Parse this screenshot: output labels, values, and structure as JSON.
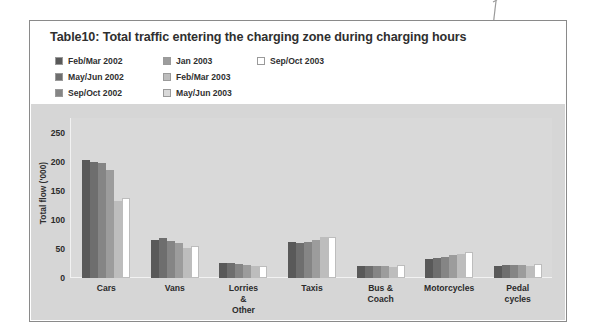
{
  "figure": {
    "title": "Table10: Total traffic entering the charging zone during charging hours",
    "annotation_dot": "callout-dot"
  },
  "legend": {
    "columns": [
      [
        {
          "label": "Feb/Mar 2002",
          "color": "#595959"
        },
        {
          "label": "May/Jun 2002",
          "color": "#6e6e6e"
        },
        {
          "label": "Sep/Oct 2002",
          "color": "#858585"
        }
      ],
      [
        {
          "label": "Jan 2003",
          "color": "#9c9c9c"
        },
        {
          "label": "Feb/Mar 2003",
          "color": "#bdbdbd"
        },
        {
          "label": "May/Jun 2003",
          "color": "#d9d9d9"
        }
      ],
      [
        {
          "label": "Sep/Oct 2003",
          "color": "#ffffff"
        }
      ]
    ]
  },
  "chart_data": {
    "type": "bar",
    "title": "Table10: Total traffic entering the charging zone during charging hours",
    "xlabel": "",
    "ylabel": "Total flow ('000)",
    "ylim": [
      0,
      275
    ],
    "yticks": [
      0,
      50,
      100,
      150,
      200,
      250
    ],
    "grid": false,
    "legend_position": "top",
    "categories": [
      "Cars",
      "Vans",
      "Lorries &\nOther",
      "Taxis",
      "Bus & Coach",
      "Motorcycles",
      "Pedal cycles"
    ],
    "series": [
      {
        "name": "Feb/Mar 2002",
        "color": "#595959",
        "values": [
          203,
          66,
          25,
          62,
          21,
          33,
          20
        ]
      },
      {
        "name": "May/Jun 2002",
        "color": "#6e6e6e",
        "values": [
          200,
          68,
          25,
          61,
          21,
          35,
          22
        ]
      },
      {
        "name": "Sep/Oct 2002",
        "color": "#858585",
        "values": [
          198,
          64,
          24,
          62,
          21,
          36,
          23
        ]
      },
      {
        "name": "Jan 2003",
        "color": "#9c9c9c",
        "values": [
          185,
          60,
          23,
          66,
          20,
          40,
          22
        ]
      },
      {
        "name": "Feb/Mar 2003",
        "color": "#bdbdbd",
        "values": [
          133,
          52,
          20,
          70,
          19,
          41,
          21
        ]
      },
      {
        "name": "Sep/Oct 2003",
        "color": "#ffffff",
        "values": [
          137,
          55,
          21,
          71,
          22,
          44,
          24
        ]
      }
    ]
  }
}
